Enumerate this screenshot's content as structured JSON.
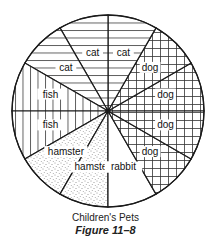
{
  "chart_data": {
    "type": "pie",
    "title": "Children's Pets",
    "figure_label": "Figure 11–8",
    "categories": [
      "dog",
      "dog",
      "cat",
      "cat",
      "cat",
      "fish",
      "fish",
      "hamster",
      "hamster",
      "rabbit",
      "dog",
      "dog"
    ],
    "values": [
      1,
      1,
      1,
      1,
      1,
      1,
      1,
      1,
      1,
      1,
      1,
      1
    ],
    "slices": [
      {
        "label": "dog",
        "start_deg": 0,
        "end_deg": 30,
        "pattern": "grid"
      },
      {
        "label": "dog",
        "start_deg": 30,
        "end_deg": 60,
        "pattern": "grid"
      },
      {
        "label": "cat",
        "start_deg": 60,
        "end_deg": 90,
        "pattern": "horizontal"
      },
      {
        "label": "cat",
        "start_deg": 90,
        "end_deg": 120,
        "pattern": "horizontal"
      },
      {
        "label": "cat",
        "start_deg": 120,
        "end_deg": 150,
        "pattern": "horizontal"
      },
      {
        "label": "fish",
        "start_deg": 150,
        "end_deg": 180,
        "pattern": "vertical"
      },
      {
        "label": "fish",
        "start_deg": 180,
        "end_deg": 210,
        "pattern": "vertical"
      },
      {
        "label": "hamster",
        "start_deg": 210,
        "end_deg": 240,
        "pattern": "dots"
      },
      {
        "label": "hamster",
        "start_deg": 240,
        "end_deg": 270,
        "pattern": "dots"
      },
      {
        "label": "rabbit",
        "start_deg": 270,
        "end_deg": 300,
        "pattern": "none"
      },
      {
        "label": "dog",
        "start_deg": 300,
        "end_deg": 330,
        "pattern": "grid"
      },
      {
        "label": "dog",
        "start_deg": 330,
        "end_deg": 360,
        "pattern": "grid"
      }
    ],
    "totals": {
      "dog": 4,
      "cat": 3,
      "fish": 2,
      "hamster": 2,
      "rabbit": 1
    },
    "total_children": 12,
    "legend": "none (labels inside slices)"
  },
  "caption": {
    "title": "Children's Pets",
    "figure": "Figure 11–8"
  },
  "colors": {
    "line": "#1a1a1a",
    "background": "#ffffff",
    "pattern": "#333333"
  }
}
